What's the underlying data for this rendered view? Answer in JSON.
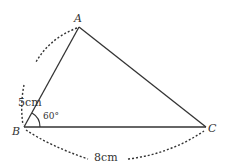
{
  "diagram": {
    "type": "triangle",
    "vertices": {
      "A": {
        "label": "A",
        "x": 79,
        "y": 27
      },
      "B": {
        "label": "B",
        "x": 24,
        "y": 127
      },
      "C": {
        "label": "C",
        "x": 206,
        "y": 127
      }
    },
    "sides": {
      "AB": {
        "label": "5cm"
      },
      "BC": {
        "label": "8cm"
      }
    },
    "angle_B": {
      "label": "60°"
    },
    "colors": {
      "stroke": "#333333",
      "text": "#333333",
      "background": "#ffffff"
    }
  }
}
